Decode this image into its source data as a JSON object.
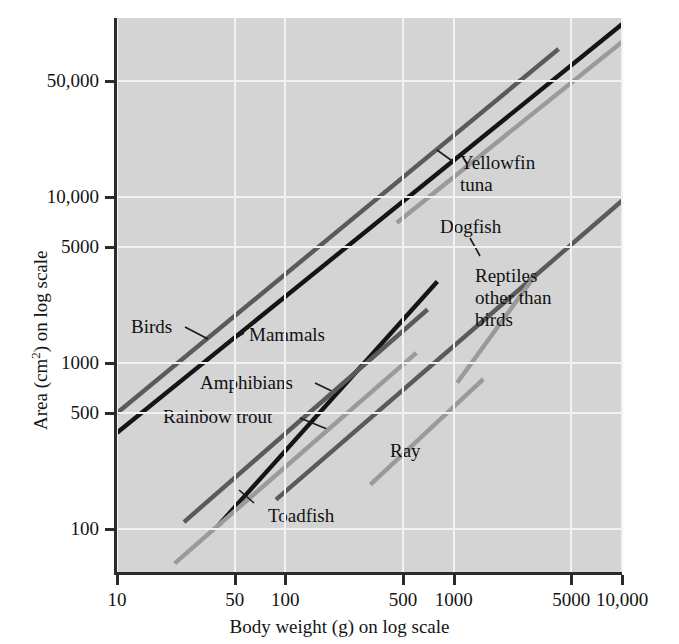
{
  "figure": {
    "background": "#ffffff",
    "plot_background": "#d4d4d4",
    "grid_color": "#f2f2f2",
    "axis_color": "#2b2b2b"
  },
  "axes": {
    "x_title_pre": "Body weight (g) on log scale",
    "y_title_pre": "Area (cm",
    "y_title_sup": "2",
    "y_title_post": ") on log scale"
  },
  "chart_data": {
    "type": "line",
    "title": "",
    "xlabel": "Body weight (g) on log scale",
    "ylabel": "Area (cm2) on log scale",
    "xscale": "log",
    "yscale": "log",
    "xlim": [
      10,
      10000
    ],
    "ylim": [
      55,
      120000
    ],
    "grid": true,
    "legend_position": "inline-annotations",
    "xticks": [
      10,
      50,
      100,
      500,
      1000,
      5000,
      10000
    ],
    "xtick_labels": [
      "10",
      "50",
      "100",
      "500",
      "1000",
      "5000",
      "10,000"
    ],
    "yticks": [
      100,
      500,
      1000,
      5000,
      10000,
      50000
    ],
    "ytick_labels": [
      "100",
      "500",
      "1000",
      "5000",
      "10,000",
      "50,000"
    ],
    "series": [
      {
        "name": "Mammals",
        "color": "#151515",
        "width": 4.4,
        "x": [
          10,
          10000
        ],
        "y": [
          380,
          110000
        ],
        "label": "Mammals",
        "label_x": 249,
        "label_y": 324,
        "leader": [
          [
            244,
            333
          ],
          [
            224,
            345
          ]
        ]
      },
      {
        "name": "Birds",
        "color": "#5a5a5a",
        "width": 4.4,
        "x": [
          10,
          4200
        ],
        "y": [
          500,
          78000
        ],
        "label": "Birds",
        "label_x": 131,
        "label_y": 316,
        "leader": [
          [
            185,
            327
          ],
          [
            208,
            339
          ]
        ]
      },
      {
        "name": "Yellowfin tuna",
        "color": "#9a9a9a",
        "width": 4.4,
        "x": [
          460,
          10000
        ],
        "y": [
          7000,
          86000
        ],
        "label": "Yellowfin\ntuna",
        "label_x": 460,
        "label_y": 152,
        "leader": [
          [
            455,
            163
          ],
          [
            437,
            150
          ]
        ]
      },
      {
        "name": "Reptiles other than birds",
        "color": "#5a5a5a",
        "width": 4.4,
        "x": [
          88,
          10000
        ],
        "y": [
          150,
          9500
        ],
        "label": "Reptiles\nother than\nbirds",
        "label_x": 475,
        "label_y": 265,
        "leader": null
      },
      {
        "name": "Dogfish",
        "color": "#9a9a9a",
        "width": 4.4,
        "x": [
          1050,
          3000
        ],
        "y": [
          760,
          3300
        ],
        "label": "Dogfish",
        "label_x": 440,
        "label_y": 216,
        "leader": [
          [
            470,
            238
          ],
          [
            480,
            256
          ]
        ]
      },
      {
        "name": "Amphibians",
        "color": "#151515",
        "width": 4.4,
        "x": [
          40,
          800
        ],
        "y": [
          105,
          3100
        ],
        "label": "Amphibians",
        "label_x": 200,
        "label_y": 372,
        "leader": [
          [
            315,
            383
          ],
          [
            338,
            394
          ]
        ]
      },
      {
        "name": "Rainbow trout",
        "color": "#5a5a5a",
        "width": 4.4,
        "x": [
          25,
          700
        ],
        "y": [
          110,
          2100
        ],
        "label": "Rainbow trout",
        "label_x": 163,
        "label_y": 406,
        "leader": [
          [
            300,
            418
          ],
          [
            327,
            429
          ]
        ]
      },
      {
        "name": "Toadfish",
        "color": "#9a9a9a",
        "width": 4.4,
        "x": [
          22,
          600
        ],
        "y": [
          62,
          1150
        ],
        "label": "Toadfish",
        "label_x": 268,
        "label_y": 505,
        "leader": [
          [
            254,
            503
          ],
          [
            239,
            490
          ]
        ]
      },
      {
        "name": "Ray",
        "color": "#9a9a9a",
        "width": 4.4,
        "x": [
          320,
          1500
        ],
        "y": [
          185,
          800
        ],
        "label": "Ray",
        "label_x": 390,
        "label_y": 440,
        "leader": null
      }
    ]
  }
}
